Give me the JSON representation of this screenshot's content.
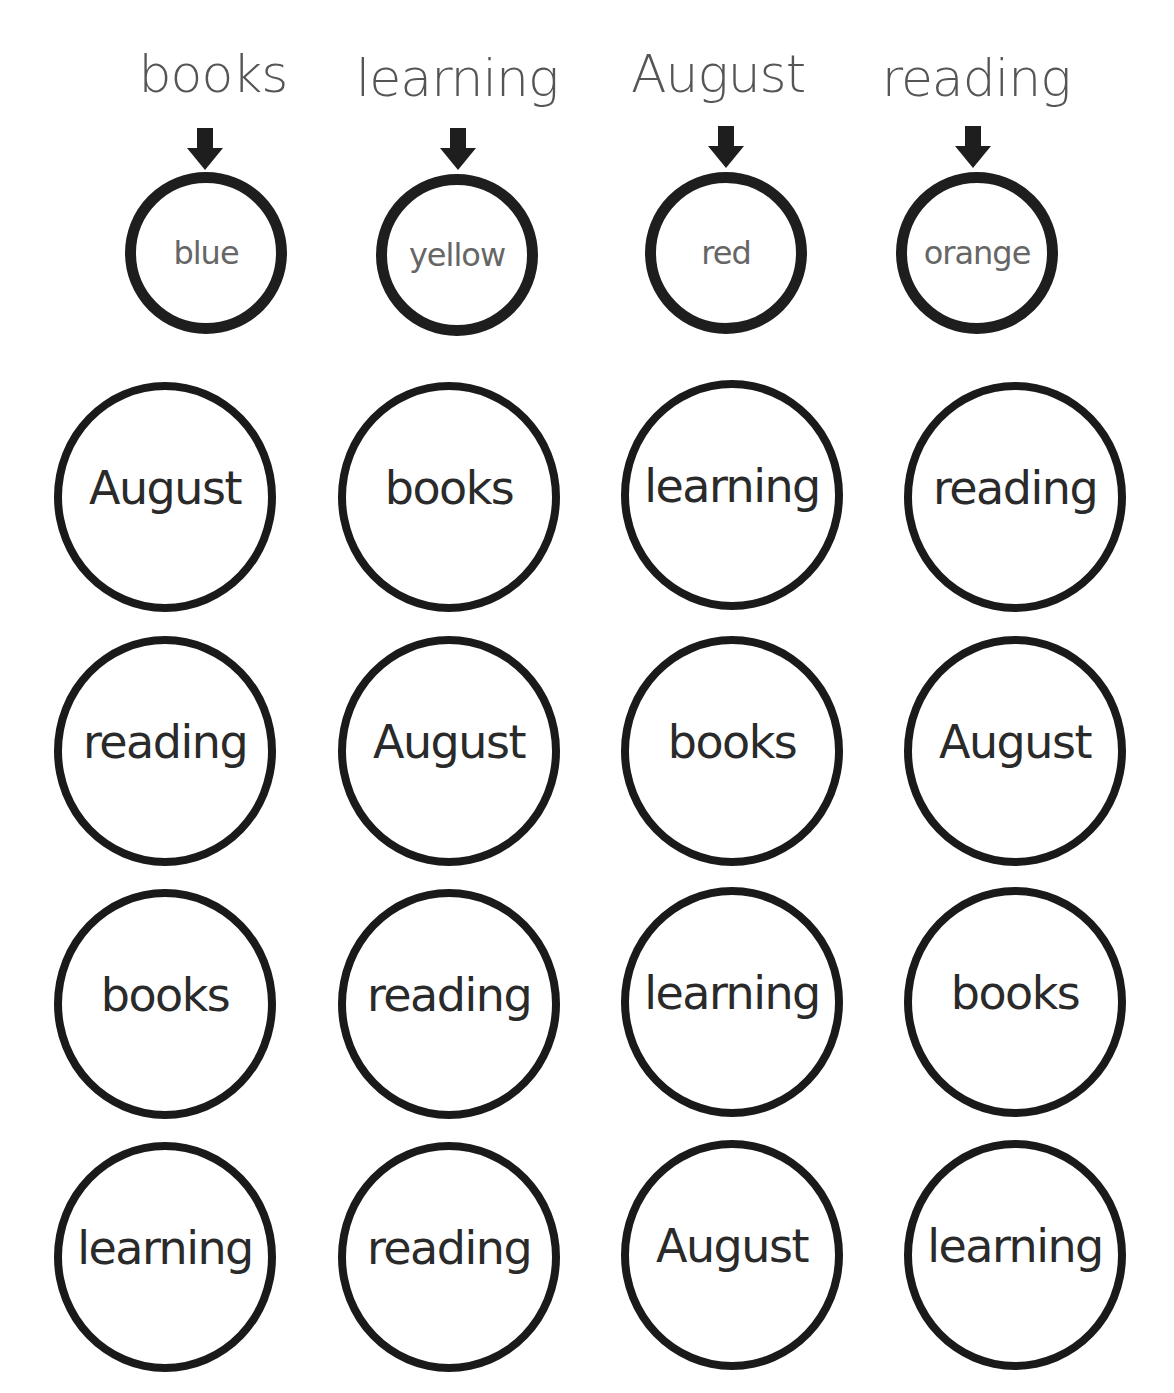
{
  "worksheet": {
    "key": [
      {
        "word": "books",
        "color": "blue"
      },
      {
        "word": "learning",
        "color": "yellow"
      },
      {
        "word": "August",
        "color": "red"
      },
      {
        "word": "reading",
        "color": "orange"
      }
    ],
    "grid": [
      [
        "August",
        "books",
        "learning",
        "reading"
      ],
      [
        "reading",
        "August",
        "books",
        "August"
      ],
      [
        "books",
        "reading",
        "learning",
        "books"
      ],
      [
        "learning",
        "reading",
        "August",
        "learning"
      ]
    ]
  },
  "colors": {
    "ink": "#1e1e1e",
    "key_text": "#555555",
    "background": "#ffffff"
  }
}
